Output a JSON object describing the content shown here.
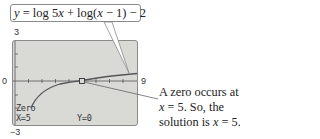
{
  "equation_callout": {
    "text": "y = log 5x + log(x − 1) − 2",
    "parts": [
      "y",
      " = log 5",
      "x",
      " + log(",
      "x",
      " − 1) − 2"
    ]
  },
  "calculator_screen": {
    "window": {
      "xmin": 0,
      "xmax": 9,
      "ymin": -3,
      "ymax": 3
    },
    "axis_labels": {
      "ymax": "3",
      "ymin": "−3",
      "xmin": "0",
      "xmax": "9"
    },
    "zero_label": "Zero",
    "x_readout": "X=5",
    "y_readout": "Y=0"
  },
  "annotation": {
    "line1": "A zero occurs at",
    "line2_var": "x",
    "line2_rest": " = 5. So, the",
    "line3_pre": "solution is ",
    "line3_var": "x",
    "line3_rest": " = 5."
  },
  "colors": {
    "screen_bg": "#d9d9d6",
    "curve": "#555555",
    "border": "#8a8a8a"
  }
}
